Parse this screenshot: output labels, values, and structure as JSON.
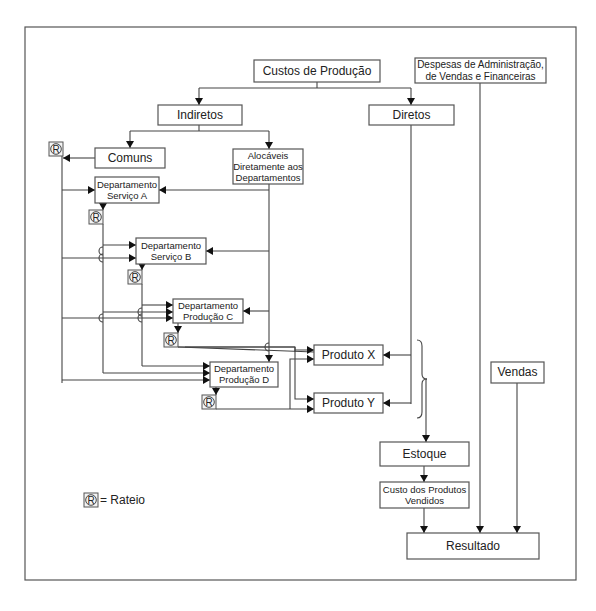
{
  "diagram": {
    "nodes": {
      "custos_producao": {
        "label": [
          "Custos de Produção"
        ],
        "x": 254,
        "y": 60,
        "w": 126,
        "h": 22,
        "fs": 12
      },
      "despesas": {
        "label": [
          "Despesas de Administração,",
          "de Vendas e Financeiras"
        ],
        "x": 415,
        "y": 58,
        "w": 131,
        "h": 25,
        "fs": 10
      },
      "indiretos": {
        "label": [
          "Indiretos"
        ],
        "x": 158,
        "y": 105,
        "w": 84,
        "h": 20,
        "fs": 12
      },
      "diretos": {
        "label": [
          "Diretos"
        ],
        "x": 369,
        "y": 105,
        "w": 85,
        "h": 20,
        "fs": 12
      },
      "comuns": {
        "label": [
          "Comuns"
        ],
        "x": 95,
        "y": 148,
        "w": 70,
        "h": 20,
        "fs": 12
      },
      "alocaveis": {
        "label": [
          "Alocáveis",
          "Diretamente aos",
          "Departamentos"
        ],
        "x": 233,
        "y": 149,
        "w": 70,
        "h": 35,
        "fs": 9.5
      },
      "dept_servico_a": {
        "label": [
          "Departamento",
          "Serviço A"
        ],
        "x": 95,
        "y": 177,
        "w": 64,
        "h": 26,
        "fs": 9.5
      },
      "dept_servico_b": {
        "label": [
          "Departamento",
          "Serviço B"
        ],
        "x": 136,
        "y": 238,
        "w": 70,
        "h": 26,
        "fs": 9.5
      },
      "dept_producao_c": {
        "label": [
          "Departamento",
          "Produção C"
        ],
        "x": 173,
        "y": 299,
        "w": 70,
        "h": 24,
        "fs": 9.5
      },
      "dept_producao_d": {
        "label": [
          "Departamento",
          "Produção D"
        ],
        "x": 210,
        "y": 362,
        "w": 68,
        "h": 25,
        "fs": 9.5
      },
      "produto_x": {
        "label": [
          "Produto X"
        ],
        "x": 314,
        "y": 345,
        "w": 69,
        "h": 20,
        "fs": 12
      },
      "produto_y": {
        "label": [
          "Produto Y"
        ],
        "x": 314,
        "y": 393,
        "w": 69,
        "h": 20,
        "fs": 12
      },
      "vendas": {
        "label": [
          "Vendas"
        ],
        "x": 491,
        "y": 362,
        "w": 53,
        "h": 21,
        "fs": 12
      },
      "estoque": {
        "label": [
          "Estoque"
        ],
        "x": 380,
        "y": 442,
        "w": 89,
        "h": 24,
        "fs": 12
      },
      "custo_produtos_vendidos": {
        "label": [
          "Custo dos Produtos",
          "Vendidos"
        ],
        "x": 380,
        "y": 482,
        "w": 89,
        "h": 26,
        "fs": 9.5
      },
      "resultado": {
        "label": [
          "Resultado"
        ],
        "x": 407,
        "y": 533,
        "w": 132,
        "h": 26,
        "fs": 12
      }
    },
    "rateio_markers": [
      {
        "x": 56,
        "y": 149
      },
      {
        "x": 96,
        "y": 217
      },
      {
        "x": 135,
        "y": 277
      },
      {
        "x": 171,
        "y": 340
      },
      {
        "x": 209,
        "y": 402
      }
    ],
    "rateio_symbol": "R",
    "legend": {
      "symbol": "R",
      "text": "= Rateio",
      "x": 84,
      "y": 500
    }
  }
}
